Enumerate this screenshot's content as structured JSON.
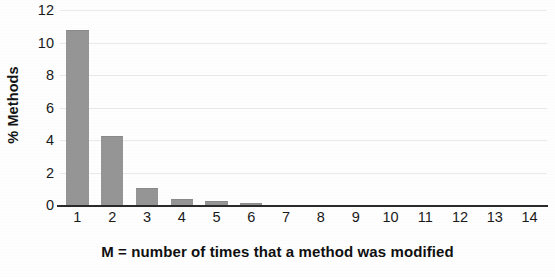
{
  "chart_data": {
    "type": "bar",
    "title": "",
    "subtitle": "",
    "xlabel": "M = number of times that a method was modified",
    "ylabel": "% Methods",
    "categories": [
      "1",
      "2",
      "3",
      "4",
      "5",
      "6",
      "7",
      "8",
      "9",
      "10",
      "11",
      "12",
      "13",
      "14"
    ],
    "values": [
      10.8,
      4.25,
      1.05,
      0.37,
      0.25,
      0.12,
      0,
      0,
      0,
      0,
      0,
      0,
      0,
      0
    ],
    "series": [
      {
        "name": "% Methods",
        "values": [
          10.8,
          4.25,
          1.05,
          0.37,
          0.25,
          0.12,
          0,
          0,
          0,
          0,
          0,
          0,
          0,
          0
        ]
      }
    ],
    "ylim": [
      0,
      12
    ],
    "yticks": [
      "12",
      "10",
      "8",
      "6",
      "4",
      "2",
      "0"
    ],
    "ytick_values": [
      12,
      10,
      8,
      6,
      4,
      2,
      0
    ],
    "xlim": [
      0.5,
      14.5
    ],
    "grid": true,
    "grid_axis": "y",
    "legend": false,
    "legend_position": "none",
    "bar_color": "#959595",
    "axis_color": "#2a2a2a",
    "grid_color": "#e9e9e9",
    "text_color": "#141414",
    "background_color": "#fefefe"
  }
}
